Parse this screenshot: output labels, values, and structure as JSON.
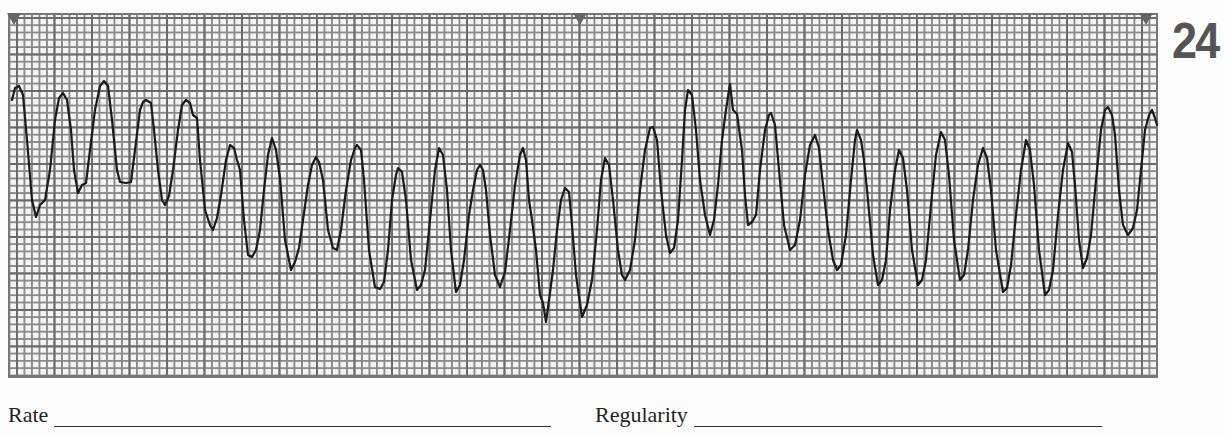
{
  "strip": {
    "number": "24",
    "grid_color": "#777777",
    "trace_color": "#1a1a1a",
    "markers": [
      {
        "x": 14
      },
      {
        "x": 580
      },
      {
        "x": 1146
      }
    ]
  },
  "fields": {
    "rate": {
      "label": "Rate",
      "value": ""
    },
    "regularity": {
      "label": "Regularity",
      "value": ""
    }
  },
  "chart_data": {
    "type": "line",
    "xlabel": "",
    "ylabel": "",
    "grid": true,
    "trace_points_px": [
      [
        12,
        100
      ],
      [
        15,
        88
      ],
      [
        19,
        86
      ],
      [
        23,
        95
      ],
      [
        27,
        140
      ],
      [
        32,
        200
      ],
      [
        36,
        217
      ],
      [
        40,
        205
      ],
      [
        45,
        200
      ],
      [
        50,
        170
      ],
      [
        55,
        120
      ],
      [
        59,
        98
      ],
      [
        63,
        93
      ],
      [
        67,
        100
      ],
      [
        71,
        130
      ],
      [
        74,
        170
      ],
      [
        78,
        193
      ],
      [
        82,
        185
      ],
      [
        86,
        183
      ],
      [
        90,
        150
      ],
      [
        95,
        110
      ],
      [
        100,
        86
      ],
      [
        104,
        81
      ],
      [
        108,
        86
      ],
      [
        112,
        120
      ],
      [
        117,
        170
      ],
      [
        120,
        182
      ],
      [
        126,
        183
      ],
      [
        131,
        182
      ],
      [
        135,
        150
      ],
      [
        140,
        110
      ],
      [
        143,
        102
      ],
      [
        146,
        100
      ],
      [
        151,
        103
      ],
      [
        154,
        130
      ],
      [
        158,
        170
      ],
      [
        162,
        200
      ],
      [
        165,
        205
      ],
      [
        169,
        196
      ],
      [
        173,
        170
      ],
      [
        178,
        130
      ],
      [
        182,
        105
      ],
      [
        186,
        100
      ],
      [
        190,
        103
      ],
      [
        193,
        115
      ],
      [
        197,
        118
      ],
      [
        200,
        160
      ],
      [
        205,
        210
      ],
      [
        210,
        225
      ],
      [
        213,
        230
      ],
      [
        217,
        218
      ],
      [
        221,
        195
      ],
      [
        226,
        160
      ],
      [
        230,
        145
      ],
      [
        234,
        148
      ],
      [
        237,
        160
      ],
      [
        240,
        170
      ],
      [
        244,
        220
      ],
      [
        248,
        255
      ],
      [
        252,
        257
      ],
      [
        256,
        250
      ],
      [
        260,
        230
      ],
      [
        264,
        190
      ],
      [
        268,
        155
      ],
      [
        272,
        138
      ],
      [
        276,
        150
      ],
      [
        280,
        178
      ],
      [
        285,
        240
      ],
      [
        291,
        270
      ],
      [
        295,
        262
      ],
      [
        299,
        248
      ],
      [
        303,
        220
      ],
      [
        308,
        185
      ],
      [
        312,
        165
      ],
      [
        316,
        157
      ],
      [
        319,
        162
      ],
      [
        323,
        180
      ],
      [
        328,
        230
      ],
      [
        333,
        248
      ],
      [
        337,
        250
      ],
      [
        341,
        230
      ],
      [
        346,
        190
      ],
      [
        351,
        160
      ],
      [
        355,
        148
      ],
      [
        357,
        145
      ],
      [
        361,
        150
      ],
      [
        364,
        180
      ],
      [
        369,
        250
      ],
      [
        375,
        287
      ],
      [
        380,
        289
      ],
      [
        384,
        282
      ],
      [
        388,
        250
      ],
      [
        392,
        200
      ],
      [
        396,
        175
      ],
      [
        398,
        168
      ],
      [
        402,
        172
      ],
      [
        406,
        200
      ],
      [
        411,
        260
      ],
      [
        417,
        290
      ],
      [
        421,
        285
      ],
      [
        425,
        270
      ],
      [
        430,
        220
      ],
      [
        435,
        170
      ],
      [
        439,
        148
      ],
      [
        443,
        155
      ],
      [
        447,
        190
      ],
      [
        451,
        250
      ],
      [
        456,
        292
      ],
      [
        460,
        285
      ],
      [
        464,
        260
      ],
      [
        469,
        215
      ],
      [
        473,
        190
      ],
      [
        477,
        170
      ],
      [
        480,
        165
      ],
      [
        483,
        170
      ],
      [
        486,
        190
      ],
      [
        490,
        235
      ],
      [
        495,
        275
      ],
      [
        500,
        287
      ],
      [
        505,
        272
      ],
      [
        510,
        230
      ],
      [
        515,
        185
      ],
      [
        520,
        155
      ],
      [
        523,
        148
      ],
      [
        526,
        160
      ],
      [
        529,
        200
      ],
      [
        532,
        220
      ],
      [
        536,
        250
      ],
      [
        540,
        295
      ],
      [
        543,
        303
      ],
      [
        546,
        322
      ],
      [
        549,
        300
      ],
      [
        553,
        270
      ],
      [
        557,
        230
      ],
      [
        561,
        200
      ],
      [
        565,
        188
      ],
      [
        569,
        192
      ],
      [
        572,
        225
      ],
      [
        576,
        275
      ],
      [
        582,
        317
      ],
      [
        587,
        305
      ],
      [
        592,
        280
      ],
      [
        597,
        230
      ],
      [
        601,
        180
      ],
      [
        605,
        158
      ],
      [
        609,
        165
      ],
      [
        613,
        200
      ],
      [
        618,
        250
      ],
      [
        622,
        275
      ],
      [
        625,
        280
      ],
      [
        630,
        270
      ],
      [
        635,
        240
      ],
      [
        640,
        190
      ],
      [
        645,
        150
      ],
      [
        650,
        128
      ],
      [
        653,
        127
      ],
      [
        657,
        140
      ],
      [
        661,
        190
      ],
      [
        666,
        235
      ],
      [
        670,
        253
      ],
      [
        674,
        248
      ],
      [
        678,
        220
      ],
      [
        682,
        160
      ],
      [
        685,
        110
      ],
      [
        688,
        90
      ],
      [
        692,
        95
      ],
      [
        696,
        130
      ],
      [
        700,
        180
      ],
      [
        705,
        215
      ],
      [
        710,
        235
      ],
      [
        714,
        220
      ],
      [
        718,
        185
      ],
      [
        722,
        140
      ],
      [
        726,
        110
      ],
      [
        729,
        90
      ],
      [
        730,
        84
      ],
      [
        733,
        110
      ],
      [
        737,
        114
      ],
      [
        742,
        150
      ],
      [
        745,
        195
      ],
      [
        748,
        225
      ],
      [
        752,
        222
      ],
      [
        756,
        215
      ],
      [
        760,
        170
      ],
      [
        765,
        130
      ],
      [
        769,
        115
      ],
      [
        771,
        113
      ],
      [
        775,
        125
      ],
      [
        779,
        170
      ],
      [
        784,
        225
      ],
      [
        790,
        250
      ],
      [
        795,
        245
      ],
      [
        800,
        220
      ],
      [
        805,
        175
      ],
      [
        810,
        145
      ],
      [
        815,
        135
      ],
      [
        819,
        148
      ],
      [
        823,
        185
      ],
      [
        828,
        230
      ],
      [
        833,
        260
      ],
      [
        837,
        270
      ],
      [
        841,
        265
      ],
      [
        846,
        235
      ],
      [
        851,
        180
      ],
      [
        855,
        140
      ],
      [
        857,
        130
      ],
      [
        861,
        140
      ],
      [
        864,
        160
      ],
      [
        868,
        200
      ],
      [
        873,
        255
      ],
      [
        878,
        285
      ],
      [
        882,
        280
      ],
      [
        886,
        260
      ],
      [
        890,
        210
      ],
      [
        895,
        170
      ],
      [
        899,
        150
      ],
      [
        903,
        158
      ],
      [
        907,
        190
      ],
      [
        912,
        250
      ],
      [
        918,
        285
      ],
      [
        922,
        280
      ],
      [
        926,
        260
      ],
      [
        931,
        205
      ],
      [
        936,
        155
      ],
      [
        941,
        132
      ],
      [
        945,
        140
      ],
      [
        949,
        175
      ],
      [
        954,
        240
      ],
      [
        960,
        280
      ],
      [
        964,
        275
      ],
      [
        968,
        250
      ],
      [
        973,
        200
      ],
      [
        978,
        165
      ],
      [
        983,
        148
      ],
      [
        987,
        158
      ],
      [
        991,
        190
      ],
      [
        996,
        250
      ],
      [
        1003,
        292
      ],
      [
        1007,
        288
      ],
      [
        1011,
        265
      ],
      [
        1016,
        215
      ],
      [
        1021,
        170
      ],
      [
        1026,
        140
      ],
      [
        1030,
        150
      ],
      [
        1034,
        185
      ],
      [
        1039,
        250
      ],
      [
        1045,
        295
      ],
      [
        1049,
        290
      ],
      [
        1053,
        270
      ],
      [
        1058,
        215
      ],
      [
        1063,
        170
      ],
      [
        1068,
        143
      ],
      [
        1072,
        152
      ],
      [
        1075,
        185
      ],
      [
        1079,
        240
      ],
      [
        1083,
        268
      ],
      [
        1087,
        258
      ],
      [
        1091,
        235
      ],
      [
        1096,
        180
      ],
      [
        1101,
        130
      ],
      [
        1105,
        110
      ],
      [
        1108,
        107
      ],
      [
        1112,
        115
      ],
      [
        1115,
        135
      ],
      [
        1119,
        190
      ],
      [
        1123,
        225
      ],
      [
        1128,
        235
      ],
      [
        1133,
        228
      ],
      [
        1137,
        210
      ],
      [
        1141,
        170
      ],
      [
        1145,
        130
      ],
      [
        1149,
        115
      ],
      [
        1152,
        110
      ],
      [
        1155,
        118
      ],
      [
        1157,
        125
      ]
    ]
  }
}
